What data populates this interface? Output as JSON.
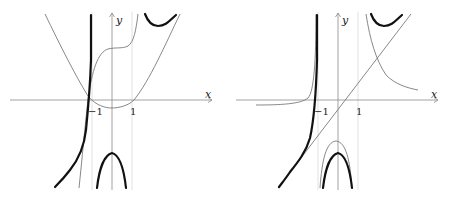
{
  "figure": {
    "panels": [
      {
        "id": "left",
        "axis_labels": {
          "x": "x",
          "y": "y"
        },
        "ticks": [
          {
            "label": "−1"
          },
          {
            "label": "1"
          }
        ],
        "curves": [
          {
            "name": "parabola",
            "style": "thin-gray"
          },
          {
            "name": "cubic-like",
            "style": "thin-gray"
          },
          {
            "name": "rational-function",
            "style": "thick-black"
          }
        ]
      },
      {
        "id": "right",
        "axis_labels": {
          "x": "x",
          "y": "y"
        },
        "ticks": [
          {
            "label": "−1"
          },
          {
            "label": "1"
          }
        ],
        "curves": [
          {
            "name": "oblique-asymptote-line",
            "style": "thin-gray"
          },
          {
            "name": "hyperbola-like",
            "style": "thin-gray"
          },
          {
            "name": "rational-function",
            "style": "thick-black"
          }
        ]
      }
    ]
  },
  "colors": {
    "thick": "#111111",
    "thin": "#7a7a7a",
    "axis": "#8a8a8a",
    "guide": "#cfcfcf"
  }
}
